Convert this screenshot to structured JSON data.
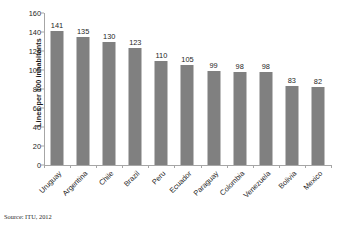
{
  "chart_data": {
    "type": "bar",
    "title": "",
    "xlabel": "",
    "ylabel": "Lines per 100 inhabitants",
    "ylim": [
      0,
      160
    ],
    "yticks": [
      0,
      20,
      40,
      60,
      80,
      100,
      120,
      140,
      160
    ],
    "grid": false,
    "legend": "none",
    "bar_color": "#808080",
    "axis_color": "#a6a6a6",
    "categories": [
      "Uruguay",
      "Argentina",
      "Chile",
      "Brazil",
      "Peru",
      "Ecuador",
      "Paraguay",
      "Colombia",
      "Venezuela",
      "Bolivia",
      "Mexico"
    ],
    "values": [
      141,
      135,
      130,
      123,
      110,
      105,
      99,
      98,
      98,
      83,
      82
    ],
    "data_labels": [
      "141",
      "135",
      "130",
      "123",
      "110",
      "105",
      "99",
      "98",
      "98",
      "83",
      "82"
    ],
    "ytick_labels": [
      "0",
      "20",
      "40",
      "60",
      "80",
      "100",
      "120",
      "140",
      "160"
    ]
  },
  "footer": {
    "source": "Source: ITU, 2012"
  }
}
